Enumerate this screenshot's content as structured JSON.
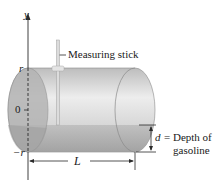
{
  "figure": {
    "axis": {
      "y_label": "y",
      "tick_top": "r",
      "tick_zero": "0",
      "tick_bottom": "−r"
    },
    "labels": {
      "stick": "Measuring stick",
      "length": "L",
      "depth_var": "d",
      "depth_eq": "= Depth of",
      "depth_line2": "gasoline"
    },
    "colors": {
      "tank_body": "#c9c9c9",
      "tank_highlight": "#ececec",
      "gasoline": "#a9a9a9",
      "line": "#2a2a2a"
    }
  }
}
